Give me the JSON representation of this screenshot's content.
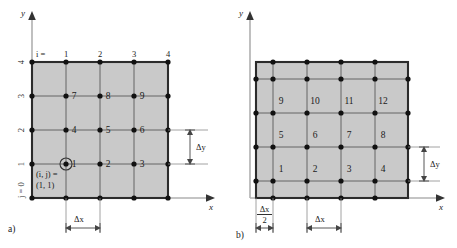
{
  "figure": {
    "type": "grid-arrangement-diagram",
    "panels": [
      {
        "id": "a",
        "label": "a)",
        "grid_type": "vertex-centered",
        "axes": {
          "x_label": "x",
          "y_label": "y"
        },
        "i_prefix": "i =",
        "i_ticks": [
          "1",
          "2",
          "3",
          "4"
        ],
        "j_ticks": [
          "4",
          "3",
          "2",
          "1"
        ],
        "j_origin_label": "j = 0",
        "origin_annotation_line1": "(i, j) =",
        "origin_annotation_line2": "(1, 1)",
        "cell_numbers": [
          "1",
          "2",
          "3",
          "4",
          "5",
          "6",
          "7",
          "8",
          "9"
        ],
        "dim_dy": "Δy",
        "dim_dx": "Δx"
      },
      {
        "id": "b",
        "label": "b)",
        "grid_type": "cell-centered",
        "axes": {
          "x_label": "x",
          "y_label": "y"
        },
        "cell_numbers": [
          "1",
          "2",
          "3",
          "4",
          "5",
          "6",
          "7",
          "8",
          "9",
          "10",
          "11",
          "12"
        ],
        "dim_dy": "Δy",
        "dim_dx": "Δx",
        "dim_half_dx_numerator": "Δx",
        "dim_half_dx_denominator": "2"
      }
    ],
    "colors": {
      "grid_fill": "#c9c9c9",
      "grid_outer_stroke": "#2b2b2b",
      "grid_inner_stroke": "#5a5a5a",
      "node_fill": "#111111",
      "axis_stroke": "#b0b0b0",
      "text": "#1a1a1a"
    }
  }
}
